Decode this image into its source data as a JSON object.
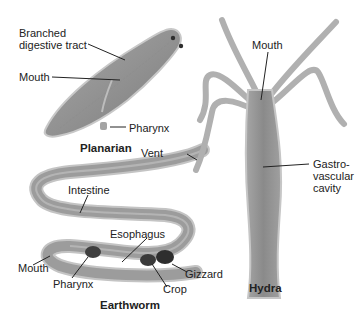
{
  "figure": {
    "organisms": [
      {
        "name": "Planarian",
        "labels": [
          "Branched digestive tract",
          "Mouth",
          "Pharynx"
        ]
      },
      {
        "name": "Earthworm",
        "labels": [
          "Vent",
          "Intestine",
          "Esophagus",
          "Mouth",
          "Pharynx",
          "Crop",
          "Gizzard"
        ]
      },
      {
        "name": "Hydra",
        "labels": [
          "Mouth",
          "Gastro-\nvascular\ncavity"
        ]
      }
    ],
    "planarian": {
      "title": "Planarian",
      "branched": "Branched\ndigestive tract",
      "mouth": "Mouth",
      "pharynx": "Pharynx"
    },
    "earthworm": {
      "title": "Earthworm",
      "vent": "Vent",
      "intestine": "Intestine",
      "esophagus": "Esophagus",
      "mouth": "Mouth",
      "pharynx": "Pharynx",
      "crop": "Crop",
      "gizzard": "Gizzard"
    },
    "hydra": {
      "title": "Hydra",
      "mouth": "Mouth",
      "gastro": "Gastro-\nvascular\ncavity"
    },
    "colors": {
      "body_fill": "#9a9a9a",
      "body_light": "#c4c4c4",
      "body_dark": "#6e6e6e",
      "organ_dark": "#3a3a3a",
      "leader_line": "#222222"
    }
  }
}
